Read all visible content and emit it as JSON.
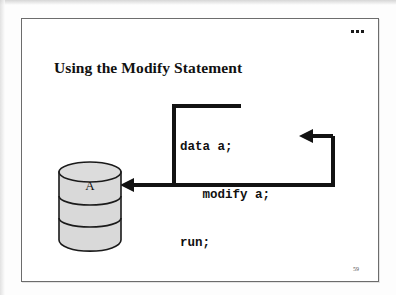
{
  "slide": {
    "title": "Using the Modify Statement",
    "page_number": "59",
    "header_marks": "...",
    "code": {
      "line1": "data a;",
      "line2": "   modify a;",
      "line3": "run;",
      "full": "data a;\n   modify a;\nrun;"
    },
    "dataset": {
      "label": "A",
      "shape": "cylinder",
      "fill_color": "#d9d9d9",
      "stroke_color": "#1a1a1a",
      "bands": 3
    },
    "arrows": [
      {
        "name": "code-to-dataset",
        "description": "thick line from top of code block down the left side and left into the dataset cylinder",
        "direction": "left",
        "target": "A"
      },
      {
        "name": "loop-back-to-modify",
        "description": "thick line from bottom of code block right, up, and left into the modify a; statement",
        "direction": "left",
        "target": "modify a;"
      }
    ],
    "colors": {
      "background": "#ffffff",
      "border": "#6c6c6c",
      "ink": "#101010",
      "cylinder_fill": "#d9d9d9"
    }
  }
}
